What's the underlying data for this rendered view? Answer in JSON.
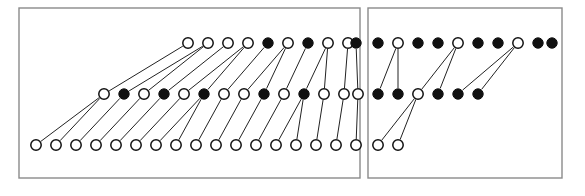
{
  "figure": {
    "title": "",
    "background_color": "#ffffff",
    "border_color": "#8a8a8a",
    "node_stroke_color": "#111111",
    "node_fill_open": "#ffffff",
    "node_fill_closed": "#111111",
    "edge_color": "#222222",
    "node_radius": 5.2,
    "node_stroke_width": 1.5,
    "edge_width": 1.0
  },
  "panels": [
    {
      "name": "left-panel",
      "label": "",
      "x": 19,
      "y": 8,
      "width": 341,
      "height": 170
    },
    {
      "name": "right-panel",
      "label": "",
      "x": 368,
      "y": 8,
      "width": 194,
      "height": 170
    }
  ],
  "rows": [
    {
      "name": "top-row",
      "y": 43
    },
    {
      "name": "middle-row",
      "y": 94
    },
    {
      "name": "bottom-row",
      "y": 145
    }
  ],
  "chart_data": {
    "type": "scatter",
    "title": "",
    "xlabel": "",
    "ylabel": "",
    "spacing_x": 20,
    "legend": [
      {
        "symbol": "open-circle",
        "fill": "#ffffff",
        "label": "open node"
      },
      {
        "symbol": "closed-circle",
        "fill": "#111111",
        "label": "closed node"
      }
    ],
    "nodes": [
      {
        "id": "t1",
        "panel": 0,
        "row": 0,
        "x": 188,
        "y": 43,
        "state": "open"
      },
      {
        "id": "t2",
        "panel": 0,
        "row": 0,
        "x": 208,
        "y": 43,
        "state": "open"
      },
      {
        "id": "t3",
        "panel": 0,
        "row": 0,
        "x": 228,
        "y": 43,
        "state": "open"
      },
      {
        "id": "t4",
        "panel": 0,
        "row": 0,
        "x": 248,
        "y": 43,
        "state": "open"
      },
      {
        "id": "t5",
        "panel": 0,
        "row": 0,
        "x": 268,
        "y": 43,
        "state": "closed"
      },
      {
        "id": "t6",
        "panel": 0,
        "row": 0,
        "x": 288,
        "y": 43,
        "state": "open"
      },
      {
        "id": "t7",
        "panel": 0,
        "row": 0,
        "x": 308,
        "y": 43,
        "state": "closed"
      },
      {
        "id": "t8",
        "panel": 0,
        "row": 0,
        "x": 328,
        "y": 43,
        "state": "open"
      },
      {
        "id": "t9",
        "panel": 0,
        "row": 0,
        "x": 348,
        "y": 43,
        "state": "open"
      },
      {
        "id": "t10",
        "panel": 0,
        "row": 0,
        "x": 356,
        "y": 43,
        "state": "closed"
      },
      {
        "id": "T1",
        "panel": 1,
        "row": 0,
        "x": 378,
        "y": 43,
        "state": "closed"
      },
      {
        "id": "T2",
        "panel": 1,
        "row": 0,
        "x": 398,
        "y": 43,
        "state": "open"
      },
      {
        "id": "T3",
        "panel": 1,
        "row": 0,
        "x": 418,
        "y": 43,
        "state": "closed"
      },
      {
        "id": "T4",
        "panel": 1,
        "row": 0,
        "x": 438,
        "y": 43,
        "state": "closed"
      },
      {
        "id": "T5",
        "panel": 1,
        "row": 0,
        "x": 458,
        "y": 43,
        "state": "open"
      },
      {
        "id": "T6",
        "panel": 1,
        "row": 0,
        "x": 478,
        "y": 43,
        "state": "closed"
      },
      {
        "id": "T7",
        "panel": 1,
        "row": 0,
        "x": 498,
        "y": 43,
        "state": "closed"
      },
      {
        "id": "T8",
        "panel": 1,
        "row": 0,
        "x": 518,
        "y": 43,
        "state": "open"
      },
      {
        "id": "T9",
        "panel": 1,
        "row": 0,
        "x": 538,
        "y": 43,
        "state": "closed"
      },
      {
        "id": "T10",
        "panel": 1,
        "row": 0,
        "x": 552,
        "y": 43,
        "state": "closed"
      },
      {
        "id": "m1",
        "panel": 0,
        "row": 1,
        "x": 104,
        "y": 94,
        "state": "open"
      },
      {
        "id": "m2",
        "panel": 0,
        "row": 1,
        "x": 124,
        "y": 94,
        "state": "closed"
      },
      {
        "id": "m3",
        "panel": 0,
        "row": 1,
        "x": 144,
        "y": 94,
        "state": "open"
      },
      {
        "id": "m4",
        "panel": 0,
        "row": 1,
        "x": 164,
        "y": 94,
        "state": "closed"
      },
      {
        "id": "m5",
        "panel": 0,
        "row": 1,
        "x": 184,
        "y": 94,
        "state": "open"
      },
      {
        "id": "m6",
        "panel": 0,
        "row": 1,
        "x": 204,
        "y": 94,
        "state": "closed"
      },
      {
        "id": "m7",
        "panel": 0,
        "row": 1,
        "x": 224,
        "y": 94,
        "state": "open"
      },
      {
        "id": "m8",
        "panel": 0,
        "row": 1,
        "x": 244,
        "y": 94,
        "state": "open"
      },
      {
        "id": "m9",
        "panel": 0,
        "row": 1,
        "x": 264,
        "y": 94,
        "state": "closed"
      },
      {
        "id": "m10",
        "panel": 0,
        "row": 1,
        "x": 284,
        "y": 94,
        "state": "open"
      },
      {
        "id": "m11",
        "panel": 0,
        "row": 1,
        "x": 304,
        "y": 94,
        "state": "closed"
      },
      {
        "id": "m12",
        "panel": 0,
        "row": 1,
        "x": 324,
        "y": 94,
        "state": "open"
      },
      {
        "id": "m13",
        "panel": 0,
        "row": 1,
        "x": 344,
        "y": 94,
        "state": "open"
      },
      {
        "id": "m14",
        "panel": 0,
        "row": 1,
        "x": 358,
        "y": 94,
        "state": "open"
      },
      {
        "id": "M1",
        "panel": 1,
        "row": 1,
        "x": 378,
        "y": 94,
        "state": "closed"
      },
      {
        "id": "M2",
        "panel": 1,
        "row": 1,
        "x": 398,
        "y": 94,
        "state": "closed"
      },
      {
        "id": "M3",
        "panel": 1,
        "row": 1,
        "x": 418,
        "y": 94,
        "state": "open"
      },
      {
        "id": "M4",
        "panel": 1,
        "row": 1,
        "x": 438,
        "y": 94,
        "state": "closed"
      },
      {
        "id": "M5",
        "panel": 1,
        "row": 1,
        "x": 458,
        "y": 94,
        "state": "closed"
      },
      {
        "id": "M6",
        "panel": 1,
        "row": 1,
        "x": 478,
        "y": 94,
        "state": "closed"
      },
      {
        "id": "b1",
        "panel": 0,
        "row": 2,
        "x": 36,
        "y": 145,
        "state": "open"
      },
      {
        "id": "b2",
        "panel": 0,
        "row": 2,
        "x": 56,
        "y": 145,
        "state": "open"
      },
      {
        "id": "b3",
        "panel": 0,
        "row": 2,
        "x": 76,
        "y": 145,
        "state": "open"
      },
      {
        "id": "b4",
        "panel": 0,
        "row": 2,
        "x": 96,
        "y": 145,
        "state": "open"
      },
      {
        "id": "b5",
        "panel": 0,
        "row": 2,
        "x": 116,
        "y": 145,
        "state": "open"
      },
      {
        "id": "b6",
        "panel": 0,
        "row": 2,
        "x": 136,
        "y": 145,
        "state": "open"
      },
      {
        "id": "b7",
        "panel": 0,
        "row": 2,
        "x": 156,
        "y": 145,
        "state": "open"
      },
      {
        "id": "b8",
        "panel": 0,
        "row": 2,
        "x": 176,
        "y": 145,
        "state": "open"
      },
      {
        "id": "b9",
        "panel": 0,
        "row": 2,
        "x": 196,
        "y": 145,
        "state": "open"
      },
      {
        "id": "b10",
        "panel": 0,
        "row": 2,
        "x": 216,
        "y": 145,
        "state": "open"
      },
      {
        "id": "b11",
        "panel": 0,
        "row": 2,
        "x": 236,
        "y": 145,
        "state": "open"
      },
      {
        "id": "b12",
        "panel": 0,
        "row": 2,
        "x": 256,
        "y": 145,
        "state": "open"
      },
      {
        "id": "b13",
        "panel": 0,
        "row": 2,
        "x": 276,
        "y": 145,
        "state": "open"
      },
      {
        "id": "b14",
        "panel": 0,
        "row": 2,
        "x": 296,
        "y": 145,
        "state": "open"
      },
      {
        "id": "b15",
        "panel": 0,
        "row": 2,
        "x": 316,
        "y": 145,
        "state": "open"
      },
      {
        "id": "b16",
        "panel": 0,
        "row": 2,
        "x": 336,
        "y": 145,
        "state": "open"
      },
      {
        "id": "b17",
        "panel": 0,
        "row": 2,
        "x": 356,
        "y": 145,
        "state": "open"
      },
      {
        "id": "B1",
        "panel": 1,
        "row": 2,
        "x": 378,
        "y": 145,
        "state": "open"
      },
      {
        "id": "B2",
        "panel": 1,
        "row": 2,
        "x": 398,
        "y": 145,
        "state": "open"
      }
    ],
    "edges": [
      {
        "from": "m1",
        "to": "t1"
      },
      {
        "from": "m2",
        "to": "t2"
      },
      {
        "from": "m3",
        "to": "t2"
      },
      {
        "from": "m4",
        "to": "t3"
      },
      {
        "from": "m5",
        "to": "t4"
      },
      {
        "from": "m6",
        "to": "t4"
      },
      {
        "from": "m7",
        "to": "t5"
      },
      {
        "from": "m8",
        "to": "t6"
      },
      {
        "from": "m9",
        "to": "t6"
      },
      {
        "from": "m10",
        "to": "t7"
      },
      {
        "from": "m11",
        "to": "t8"
      },
      {
        "from": "m12",
        "to": "t8"
      },
      {
        "from": "m13",
        "to": "t9"
      },
      {
        "from": "m14",
        "to": "t10"
      },
      {
        "from": "M1",
        "to": "T2"
      },
      {
        "from": "M2",
        "to": "T2"
      },
      {
        "from": "M3",
        "to": "T5"
      },
      {
        "from": "M4",
        "to": "T5"
      },
      {
        "from": "M5",
        "to": "T8"
      },
      {
        "from": "M6",
        "to": "T8"
      },
      {
        "from": "b1",
        "to": "m1"
      },
      {
        "from": "b2",
        "to": "m1"
      },
      {
        "from": "b3",
        "to": "m2"
      },
      {
        "from": "b4",
        "to": "m3"
      },
      {
        "from": "b5",
        "to": "m4"
      },
      {
        "from": "b6",
        "to": "m5"
      },
      {
        "from": "b7",
        "to": "m6"
      },
      {
        "from": "b8",
        "to": "m6"
      },
      {
        "from": "b9",
        "to": "m7"
      },
      {
        "from": "b10",
        "to": "m8"
      },
      {
        "from": "b11",
        "to": "m9"
      },
      {
        "from": "b12",
        "to": "m10"
      },
      {
        "from": "b13",
        "to": "m11"
      },
      {
        "from": "b14",
        "to": "m11"
      },
      {
        "from": "b15",
        "to": "m12"
      },
      {
        "from": "b16",
        "to": "m13"
      },
      {
        "from": "b17",
        "to": "m14"
      },
      {
        "from": "B1",
        "to": "M3"
      },
      {
        "from": "B2",
        "to": "M3"
      }
    ]
  }
}
